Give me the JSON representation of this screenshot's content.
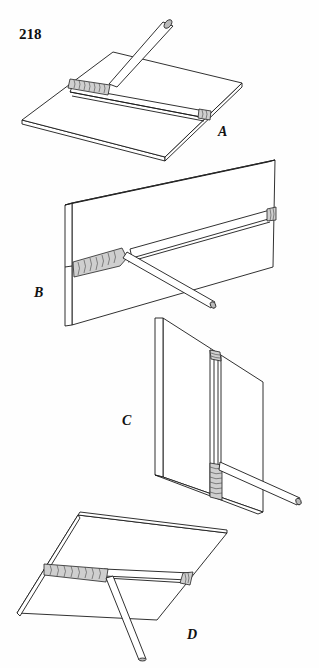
{
  "page": {
    "number": "218"
  },
  "figures": [
    {
      "id": "A",
      "label": "A",
      "description": "Flat position fillet weld: rod over horizontal plate with vertical member"
    },
    {
      "id": "B",
      "label": "B",
      "description": "Horizontal position weld on vertical plate"
    },
    {
      "id": "C",
      "label": "C",
      "description": "Vertical position weld on vertical plate"
    },
    {
      "id": "D",
      "label": "D",
      "description": "Overhead position weld under horizontal plate"
    }
  ],
  "colors": {
    "line": "#1a1a1a",
    "weld_bead": "#cfcfcf",
    "background": "#fefefe"
  }
}
